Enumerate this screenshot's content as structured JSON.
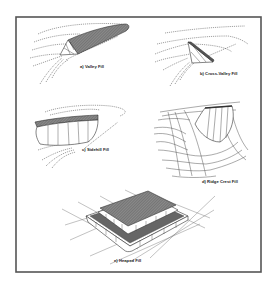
{
  "figure": {
    "type": "diagram",
    "panels": [
      {
        "id": "a",
        "label": "a) Valley Fill"
      },
      {
        "id": "b",
        "label": "b) Cross-Valley Fill"
      },
      {
        "id": "c",
        "label": "c) Sidehill Fill"
      },
      {
        "id": "d",
        "label": "d) Ridge Crest Fill"
      },
      {
        "id": "e",
        "label": "e) Heaped Fill"
      }
    ],
    "colors": {
      "frame": "#555555",
      "line": "#333333",
      "fill_top": "#7a7a7a",
      "background": "#ffffff"
    }
  }
}
